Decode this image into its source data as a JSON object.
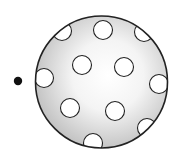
{
  "diagram": {
    "width": 181,
    "height": 161,
    "background": "#ffffff",
    "dot": {
      "cx": 18,
      "cy": 81,
      "r": 4.2,
      "color": "#111111"
    },
    "sphere": {
      "cx": 101.5,
      "cy": 82,
      "r": 66,
      "stroke": "#222222",
      "highlight_color": "#ffffff",
      "shade_color": "#bdbdbd"
    },
    "spots": [
      {
        "cx": 62,
        "cy": 31,
        "r": 9.5
      },
      {
        "cx": 103,
        "cy": 30,
        "r": 9.5
      },
      {
        "cx": 144,
        "cy": 32,
        "r": 9.5
      },
      {
        "cx": 82,
        "cy": 65,
        "r": 9.5
      },
      {
        "cx": 124,
        "cy": 67,
        "r": 9.5
      },
      {
        "cx": 44,
        "cy": 78,
        "r": 9.5
      },
      {
        "cx": 159,
        "cy": 84,
        "r": 9.5
      },
      {
        "cx": 70,
        "cy": 108,
        "r": 9.5
      },
      {
        "cx": 115,
        "cy": 111,
        "r": 9.5
      },
      {
        "cx": 147,
        "cy": 128,
        "r": 9.5
      },
      {
        "cx": 93,
        "cy": 143,
        "r": 9.5
      }
    ]
  }
}
